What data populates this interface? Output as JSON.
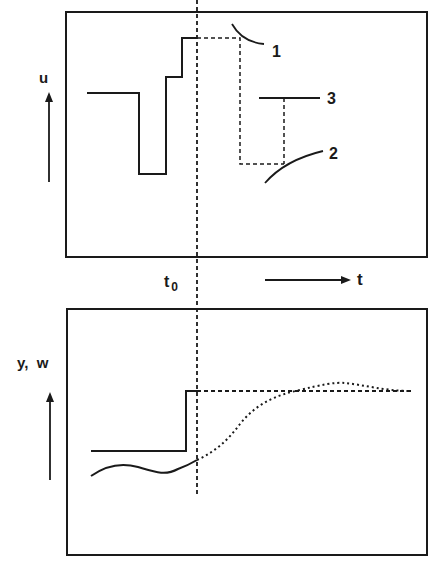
{
  "figure": {
    "upper_panel": {
      "axis_label": "u",
      "curve_labels": [
        "1",
        "2",
        "3"
      ]
    },
    "lower_panel": {
      "axis_label": "y,  w"
    },
    "time_axis": {
      "marker_label": "t",
      "marker_subscript": "0",
      "axis_label": "t"
    }
  },
  "colors": {
    "ink": "#1a1a1a",
    "background": "#ffffff"
  }
}
